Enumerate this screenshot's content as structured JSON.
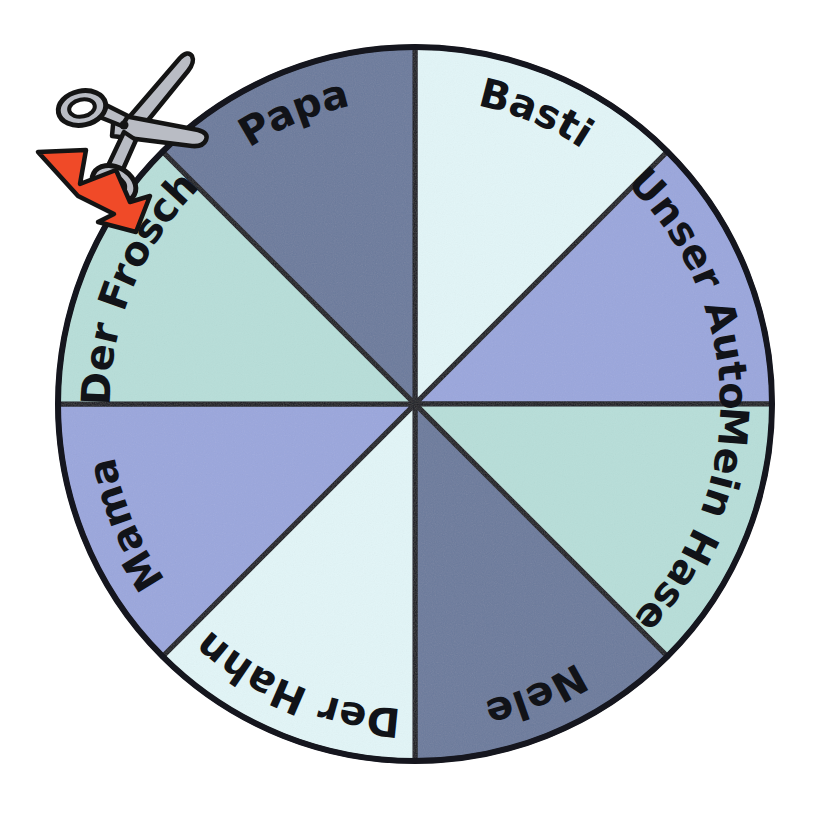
{
  "page": {
    "background_color": "#ffffff",
    "width": 815,
    "height": 831
  },
  "wheel": {
    "name": "word-wheel",
    "center_x": 415,
    "center_y": 404,
    "radius": 357,
    "outline_color": "#15161e",
    "outline_width": 5,
    "segment_count": 8,
    "segment_angle_deg": 45,
    "palette": {
      "pale_cyan": "#e2f5f7",
      "periwinkle": "#9aa6dc",
      "mint": "#b7ded9",
      "slate_blue": "#6b7a9c"
    },
    "segments": [
      {
        "label": "Basti",
        "color": "#e2f5f7",
        "start_deg": 0,
        "end_deg": 45,
        "text_flip": false
      },
      {
        "label": "Unser Auto",
        "color": "#9aa6dc",
        "start_deg": 45,
        "end_deg": 90,
        "text_flip": false
      },
      {
        "label": "Mein Hase",
        "color": "#b7ded9",
        "start_deg": 90,
        "end_deg": 135,
        "text_flip": false
      },
      {
        "label": "Nele",
        "color": "#6b7a9c",
        "start_deg": 135,
        "end_deg": 180,
        "text_flip": false
      },
      {
        "label": "Der Hahn",
        "color": "#e2f5f7",
        "start_deg": 180,
        "end_deg": 225,
        "text_flip": false
      },
      {
        "label": "Mama",
        "color": "#9aa6dc",
        "start_deg": 225,
        "end_deg": 270,
        "text_flip": false
      },
      {
        "label": "Der Frosch",
        "color": "#b7ded9",
        "start_deg": 270,
        "end_deg": 315,
        "text_flip": false
      },
      {
        "label": "Papa",
        "color": "#6b7a9c",
        "start_deg": 315,
        "end_deg": 360,
        "text_flip": false
      }
    ]
  },
  "annotations": {
    "scissors": {
      "icon_name": "scissors-icon",
      "blade_fill": "#b9bcc4",
      "outline_color": "#141414",
      "x": 62,
      "y": 52,
      "width": 112,
      "height": 100
    },
    "arrow": {
      "icon_name": "cut-here-arrow-icon",
      "fill": "#f04a28",
      "outline_color": "#141414",
      "direction": "down-right",
      "x": 38,
      "y": 140,
      "width": 110,
      "height": 80
    }
  }
}
